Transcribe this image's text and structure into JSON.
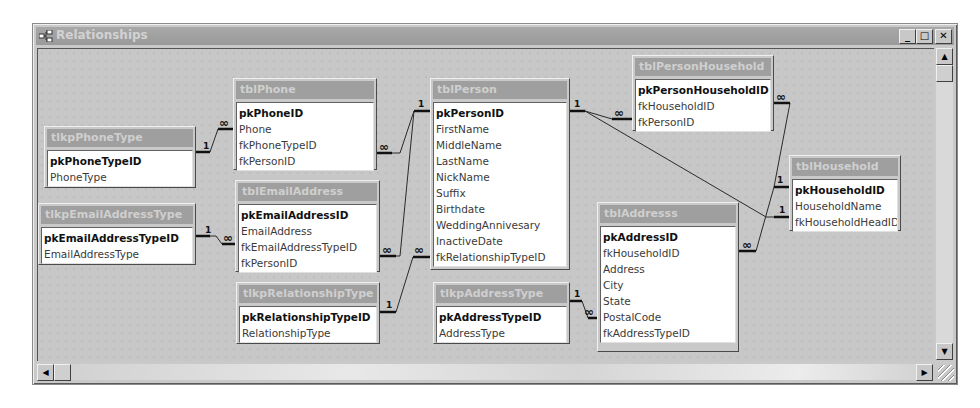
{
  "window": {
    "title": "Relationships",
    "title_icon": "relationships-icon",
    "buttons": {
      "minimize": "_",
      "maximize": "□",
      "close": "✕"
    }
  },
  "scrollbars": {
    "up": "▲",
    "down": "▼",
    "left": "◀",
    "right": "▶"
  },
  "tables": {
    "tlkpPhoneType": {
      "name": "tlkpPhoneType",
      "fields": [
        "pkPhoneTypeID",
        "PhoneType"
      ]
    },
    "tlkpEmailAddressType": {
      "name": "tlkpEmailAddressType",
      "fields": [
        "pkEmailAddressTypeID",
        "EmailAddressType"
      ]
    },
    "tblPhone": {
      "name": "tblPhone",
      "fields": [
        "pkPhoneID",
        "Phone",
        "fkPhoneTypeID",
        "fkPersonID"
      ]
    },
    "tblEmailAddress": {
      "name": "tblEmailAddress",
      "fields": [
        "pkEmailAddressID",
        "EmailAddress",
        "fkEmailAddressTypeID",
        "fkPersonID"
      ]
    },
    "tlkpRelationshipType": {
      "name": "tlkpRelationshipType",
      "fields": [
        "pkRelationshipTypeID",
        "RelationshipType"
      ]
    },
    "tblPerson": {
      "name": "tblPerson",
      "fields": [
        "pkPersonID",
        "FirstName",
        "MiddleName",
        "LastName",
        "NickName",
        "Suffix",
        "Birthdate",
        "WeddingAnnivesary",
        "InactiveDate",
        "fkRelationshipTypeID"
      ]
    },
    "tlkpAddressType": {
      "name": "tlkpAddressType",
      "fields": [
        "pkAddressTypeID",
        "AddressType"
      ]
    },
    "tblPersonHousehold": {
      "name": "tblPersonHousehold",
      "fields": [
        "pkPersonHouseholdID",
        "fkHouseholdID",
        "fkPersonID"
      ]
    },
    "tblAddresss": {
      "name": "tblAddresss",
      "fields": [
        "pkAddressID",
        "fkHouseholdID",
        "Address",
        "City",
        "State",
        "PostalCode",
        "fkAddressTypeID"
      ]
    },
    "tblHousehold": {
      "name": "tblHousehold",
      "fields": [
        "pkHouseholdID",
        "HouseholdName",
        "fkHouseholdHeadID"
      ]
    }
  },
  "cardinality": {
    "one": "1",
    "many": "∞"
  }
}
